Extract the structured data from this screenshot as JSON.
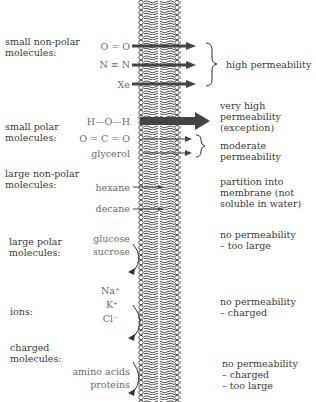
{
  "diagram": {
    "categories": [
      {
        "label_line1": "small non-polar",
        "label_line2": "molecules:",
        "molecules": [
          "O = O",
          "N ≡ N",
          "Xe"
        ],
        "result": [
          "high permeability"
        ]
      },
      {
        "label_line1": "small polar",
        "label_line2": "molecules:",
        "molecules": [
          "H—O—H",
          "O = C = O",
          "glycerol"
        ],
        "result_water": [
          "very high",
          "permeability",
          "(exception)"
        ],
        "result": [
          "moderate",
          "permeability"
        ]
      },
      {
        "label_line1": "large non-polar",
        "label_line2": "molecules:",
        "molecules": [
          "hexane",
          "decane"
        ],
        "result": [
          "partition into",
          "membrane (not",
          "soluble in water)"
        ]
      },
      {
        "label_line1": "large polar",
        "label_line2": "molecules:",
        "molecules": [
          "glucose",
          "sucrose"
        ],
        "result": [
          "no permeability",
          "– too large"
        ]
      },
      {
        "label_line1": "ions:",
        "label_line2": "",
        "molecules": [
          "Na⁺",
          "K⁺",
          "Cl⁻"
        ],
        "result": [
          "no permeability",
          "– charged"
        ]
      },
      {
        "label_line1": "charged",
        "label_line2": "molecules:",
        "molecules": [
          "amino acids",
          "proteins"
        ],
        "result": [
          "no permeability",
          "– charged",
          "– too large"
        ]
      }
    ]
  }
}
